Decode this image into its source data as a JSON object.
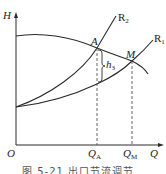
{
  "figure": {
    "axes": {
      "y_label": "H",
      "x_label": "Q",
      "origin_label": "O"
    },
    "curves": {
      "pump_curve": "H-Q",
      "r2_label": "R",
      "r2_sub": "2",
      "r1_label": "R",
      "r1_sub": "1"
    },
    "points": {
      "a_label": "A",
      "m_label": "M"
    },
    "annotations": {
      "h3_label": "h",
      "h3_sub": "3"
    },
    "ticks": {
      "qa_label": "Q",
      "qa_sub": "A",
      "qm_label": "Q",
      "qm_sub": "M"
    },
    "caption": "图 5-21   出口节流调节"
  },
  "colors": {
    "line": "#2a2a2a",
    "dashed": "#555555",
    "background": "#ffffff"
  }
}
